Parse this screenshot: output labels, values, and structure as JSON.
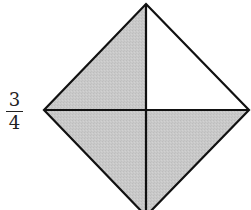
{
  "label": {
    "numerator": "3",
    "denominator": "4"
  },
  "figure": {
    "shape": "square rotated 45° (diamond) divided into 4 triangular quadrants",
    "fill_color": "#c8c8c8",
    "stroke_color": "#111111",
    "background": "#ffffff",
    "quadrants": [
      {
        "name": "top-left",
        "shaded": true
      },
      {
        "name": "top-right",
        "shaded": false
      },
      {
        "name": "bottom-left",
        "shaded": true
      },
      {
        "name": "bottom-right",
        "shaded": true
      }
    ],
    "shaded_count": 3,
    "total_count": 4
  }
}
